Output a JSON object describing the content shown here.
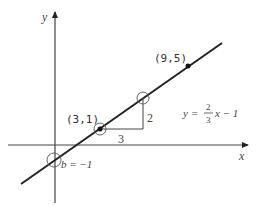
{
  "diagram": {
    "type": "coordinate-plane-line",
    "axes": {
      "x_label": "x",
      "y_label": "y"
    },
    "line": {
      "equation_lhs": "y =",
      "slope_numerator": "2",
      "slope_denominator": "3",
      "equation_rhs": "x − 1",
      "slope": "2/3",
      "intercept": -1
    },
    "points": [
      {
        "label": "(3,1)",
        "x": 3,
        "y": 1,
        "marker": "filled-dot-circled"
      },
      {
        "label": "(9,5)",
        "x": 9,
        "y": 5,
        "marker": "filled-dot"
      },
      {
        "label": "",
        "x": 6,
        "y": 3,
        "marker": "circle"
      },
      {
        "label": "",
        "x": 0,
        "y": -1,
        "marker": "circle"
      }
    ],
    "intercept_label": "b = −1",
    "slope_triangle": {
      "run_label": "3",
      "rise_label": "2"
    },
    "colors": {
      "line": "#222222",
      "axes": "#444444",
      "background": "#ffffff"
    }
  }
}
